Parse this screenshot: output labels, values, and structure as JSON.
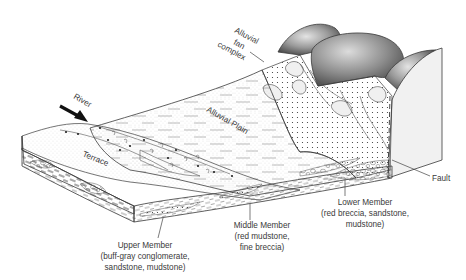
{
  "diagram": {
    "type": "geologic block diagram",
    "labels": {
      "river": "River",
      "alluvial_fan": [
        "Alluvial",
        "fan",
        "complex"
      ],
      "alluvial_plain": "Alluvial Plain",
      "terrace": "Terrace",
      "fault": "Fault",
      "upper_member": [
        "Upper Member",
        "(buff-gray conglomerate,",
        "sandstone, mudstone)"
      ],
      "middle_member": [
        "Middle Member",
        "(red mudstone,",
        "fine breccia)"
      ],
      "lower_member": [
        "Lower Member",
        "(red breccia, sandstone,",
        "mudstone)"
      ]
    },
    "colors": {
      "line": "#3a3a3a",
      "mountain_dark": "#5a5a5a",
      "mountain_light": "#d8d8d8",
      "fault_face": "#f0f0f0",
      "background": "#ffffff"
    }
  }
}
